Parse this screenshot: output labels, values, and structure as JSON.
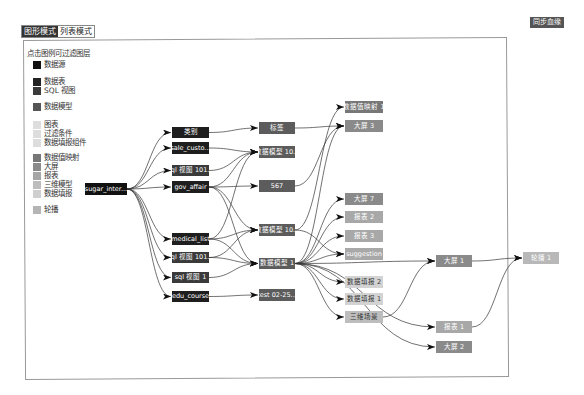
{
  "toolbar": {
    "mode_tabs": [
      {
        "label": "图形模式",
        "active": true
      },
      {
        "label": "列表模式",
        "active": false
      }
    ],
    "sync_button": "同步血缘"
  },
  "legend": {
    "title": "点击图例可过滤图层",
    "items": [
      {
        "label": "数据源",
        "color": "#111111",
        "y": 0
      },
      {
        "label": "数据表",
        "color": "#222222",
        "y": 17
      },
      {
        "label": "SQL 视图",
        "color": "#3a3a3a",
        "y": 26
      },
      {
        "label": "数据模型",
        "color": "#555555",
        "y": 42
      },
      {
        "label": "图表",
        "color": "#dddddd",
        "y": 60
      },
      {
        "label": "过滤条件",
        "color": "#dddddd",
        "y": 69
      },
      {
        "label": "数据填报组件",
        "color": "#dddddd",
        "y": 78
      },
      {
        "label": "数据值映射",
        "color": "#777777",
        "y": 93
      },
      {
        "label": "大屏",
        "color": "#8a8a8a",
        "y": 102
      },
      {
        "label": "报表",
        "color": "#a6a6a6",
        "y": 111
      },
      {
        "label": "三维模型",
        "color": "#bdbdbd",
        "y": 120
      },
      {
        "label": "数据填报",
        "color": "#cfcfcf",
        "y": 129
      },
      {
        "label": "轮播",
        "color": "#b5b5b5",
        "y": 145
      }
    ]
  },
  "graph": {
    "nodes": [
      {
        "id": "n0",
        "label": "sugar_inter...",
        "type": "数据源",
        "x": 85,
        "y": 183,
        "w": 42,
        "h": 12,
        "bg": "#111111",
        "fg": "#ffffff"
      },
      {
        "id": "n1",
        "label": "类别",
        "type": "数据表",
        "x": 172,
        "y": 127,
        "w": 37,
        "h": 11,
        "bg": "#1e1e1e",
        "fg": "#ffffff"
      },
      {
        "id": "n2",
        "label": "sale_custo...",
        "type": "数据表",
        "x": 172,
        "y": 142,
        "w": 37,
        "h": 12,
        "bg": "#1e1e1e",
        "fg": "#ffffff"
      },
      {
        "id": "n3",
        "label": "sql 视图 101...",
        "type": "SQL 视图",
        "x": 172,
        "y": 165,
        "w": 37,
        "h": 11,
        "bg": "#3a3a3a",
        "fg": "#ffffff"
      },
      {
        "id": "n4",
        "label": "gov_affair",
        "type": "数据表",
        "x": 172,
        "y": 181,
        "w": 37,
        "h": 12,
        "bg": "#1e1e1e",
        "fg": "#ffffff"
      },
      {
        "id": "n5",
        "label": "medical_list",
        "type": "数据表",
        "x": 172,
        "y": 233,
        "w": 37,
        "h": 12,
        "bg": "#1e1e1e",
        "fg": "#ffffff"
      },
      {
        "id": "n6",
        "label": "sql 视图 101...",
        "type": "SQL 视图",
        "x": 172,
        "y": 252,
        "w": 37,
        "h": 11,
        "bg": "#3a3a3a",
        "fg": "#ffffff"
      },
      {
        "id": "n7",
        "label": "sql 视图 1",
        "type": "SQL 视图",
        "x": 172,
        "y": 272,
        "w": 37,
        "h": 11,
        "bg": "#3a3a3a",
        "fg": "#ffffff"
      },
      {
        "id": "n8",
        "label": "edu_course",
        "type": "数据表",
        "x": 172,
        "y": 291,
        "w": 37,
        "h": 11,
        "bg": "#1e1e1e",
        "fg": "#ffffff"
      },
      {
        "id": "n9",
        "label": "标签",
        "type": "数据模型",
        "x": 259,
        "y": 122,
        "w": 36,
        "h": 12,
        "bg": "#5c5c5c",
        "fg": "#ffffff"
      },
      {
        "id": "n10",
        "label": "数据模型 10...",
        "type": "数据模型",
        "x": 259,
        "y": 146,
        "w": 36,
        "h": 12,
        "bg": "#5c5c5c",
        "fg": "#ffffff"
      },
      {
        "id": "n11",
        "label": "567",
        "type": "数据模型",
        "x": 259,
        "y": 180,
        "w": 36,
        "h": 12,
        "bg": "#5c5c5c",
        "fg": "#ffffff"
      },
      {
        "id": "n12",
        "label": "数据模型 10...",
        "type": "数据模型",
        "x": 259,
        "y": 224,
        "w": 36,
        "h": 12,
        "bg": "#5c5c5c",
        "fg": "#ffffff"
      },
      {
        "id": "n13",
        "label": "数据模型 1",
        "type": "数据模型",
        "x": 259,
        "y": 258,
        "w": 36,
        "h": 11,
        "bg": "#5c5c5c",
        "fg": "#ffffff"
      },
      {
        "id": "n14",
        "label": "test 02-25...",
        "type": "数据模型",
        "x": 259,
        "y": 289,
        "w": 36,
        "h": 12,
        "bg": "#5c5c5c",
        "fg": "#ffffff"
      },
      {
        "id": "n15",
        "label": "数据值映射 1",
        "type": "数据值映射",
        "x": 345,
        "y": 101,
        "w": 38,
        "h": 12,
        "bg": "#777777",
        "fg": "#ffffff"
      },
      {
        "id": "n16",
        "label": "大屏 3",
        "type": "大屏",
        "x": 345,
        "y": 120,
        "w": 38,
        "h": 12,
        "bg": "#8a8a8a",
        "fg": "#ffffff"
      },
      {
        "id": "n17",
        "label": "大屏 7",
        "type": "大屏",
        "x": 345,
        "y": 193,
        "w": 38,
        "h": 12,
        "bg": "#8a8a8a",
        "fg": "#ffffff"
      },
      {
        "id": "n18",
        "label": "报表 2",
        "type": "报表",
        "x": 345,
        "y": 211,
        "w": 38,
        "h": 12,
        "bg": "#a8a8a8",
        "fg": "#ffffff"
      },
      {
        "id": "n19",
        "label": "报表 3",
        "type": "报表",
        "x": 345,
        "y": 230,
        "w": 38,
        "h": 12,
        "bg": "#a8a8a8",
        "fg": "#ffffff"
      },
      {
        "id": "n20",
        "label": "suggestion",
        "type": "报表",
        "x": 345,
        "y": 248,
        "w": 38,
        "h": 12,
        "bg": "#a8a8a8",
        "fg": "#ffffff"
      },
      {
        "id": "n21",
        "label": "数据填报 2",
        "type": "数据填报",
        "x": 345,
        "y": 276,
        "w": 38,
        "h": 12,
        "bg": "#d3d3d3",
        "fg": "#333333"
      },
      {
        "id": "n22",
        "label": "数据填报 1",
        "type": "数据填报",
        "x": 345,
        "y": 293,
        "w": 38,
        "h": 12,
        "bg": "#d3d3d3",
        "fg": "#333333"
      },
      {
        "id": "n23",
        "label": "三维场景",
        "type": "三维模型",
        "x": 345,
        "y": 311,
        "w": 38,
        "h": 12,
        "bg": "#bdbdbd",
        "fg": "#333333"
      },
      {
        "id": "n24",
        "label": "大屏 1",
        "type": "大屏",
        "x": 436,
        "y": 255,
        "w": 36,
        "h": 12,
        "bg": "#8a8a8a",
        "fg": "#ffffff"
      },
      {
        "id": "n25",
        "label": "轮播 1",
        "type": "轮播",
        "x": 523,
        "y": 252,
        "w": 36,
        "h": 12,
        "bg": "#b8b8b8",
        "fg": "#ffffff"
      },
      {
        "id": "n26",
        "label": "报表 1",
        "type": "报表",
        "x": 436,
        "y": 321,
        "w": 36,
        "h": 12,
        "bg": "#a8a8a8",
        "fg": "#ffffff"
      },
      {
        "id": "n27",
        "label": "大屏 2",
        "type": "大屏",
        "x": 436,
        "y": 341,
        "w": 36,
        "h": 12,
        "bg": "#8a8a8a",
        "fg": "#ffffff"
      }
    ],
    "edges": [
      [
        "n0",
        "n1"
      ],
      [
        "n0",
        "n2"
      ],
      [
        "n0",
        "n3"
      ],
      [
        "n0",
        "n4"
      ],
      [
        "n0",
        "n5"
      ],
      [
        "n0",
        "n6"
      ],
      [
        "n0",
        "n7"
      ],
      [
        "n0",
        "n8"
      ],
      [
        "n1",
        "n9"
      ],
      [
        "n2",
        "n10"
      ],
      [
        "n3",
        "n10"
      ],
      [
        "n4",
        "n10"
      ],
      [
        "n4",
        "n11"
      ],
      [
        "n4",
        "n12"
      ],
      [
        "n4",
        "n13"
      ],
      [
        "n5",
        "n10"
      ],
      [
        "n5",
        "n12"
      ],
      [
        "n5",
        "n13"
      ],
      [
        "n6",
        "n12"
      ],
      [
        "n6",
        "n13"
      ],
      [
        "n7",
        "n13"
      ],
      [
        "n8",
        "n14"
      ],
      [
        "n9",
        "n16"
      ],
      [
        "n11",
        "n16"
      ],
      [
        "n12",
        "n15"
      ],
      [
        "n13",
        "n16"
      ],
      [
        "n13",
        "n17"
      ],
      [
        "n13",
        "n18"
      ],
      [
        "n13",
        "n19"
      ],
      [
        "n13",
        "n20"
      ],
      [
        "n12",
        "n20"
      ],
      [
        "n13",
        "n21"
      ],
      [
        "n13",
        "n22"
      ],
      [
        "n13",
        "n23"
      ],
      [
        "n13",
        "n24"
      ],
      [
        "n13",
        "n26"
      ],
      [
        "n13",
        "n27"
      ],
      [
        "n23",
        "n24"
      ],
      [
        "n24",
        "n25"
      ],
      [
        "n26",
        "n25"
      ]
    ]
  }
}
